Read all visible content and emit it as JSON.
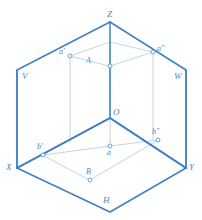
{
  "figure": {
    "colors": {
      "plane_edge": "#3f80c4",
      "construction_line": "#a9cbe8",
      "axis_line": "#3f80c4",
      "marker_stroke": "#5b9ad5",
      "marker_fill": "#ffffff",
      "label_color": "#4a86c8",
      "background": "#ffffff"
    }
  },
  "planes": {
    "frontal": {
      "label": "V"
    },
    "profile": {
      "label": "W"
    },
    "horizontal": {
      "label": "H"
    }
  },
  "axes": {
    "z": {
      "label": "Z"
    },
    "x": {
      "label": "X"
    },
    "y": {
      "label": "Y"
    },
    "origin": {
      "label": "O"
    }
  },
  "points": {
    "A": {
      "label": "A"
    },
    "a_frontal": {
      "label": "a'"
    },
    "a_profile": {
      "label": "a″"
    },
    "a_horizontal": {
      "label": "a"
    },
    "B": {
      "label": "B"
    },
    "b_frontal": {
      "label": "b'"
    },
    "b_profile": {
      "label": "b″"
    }
  }
}
